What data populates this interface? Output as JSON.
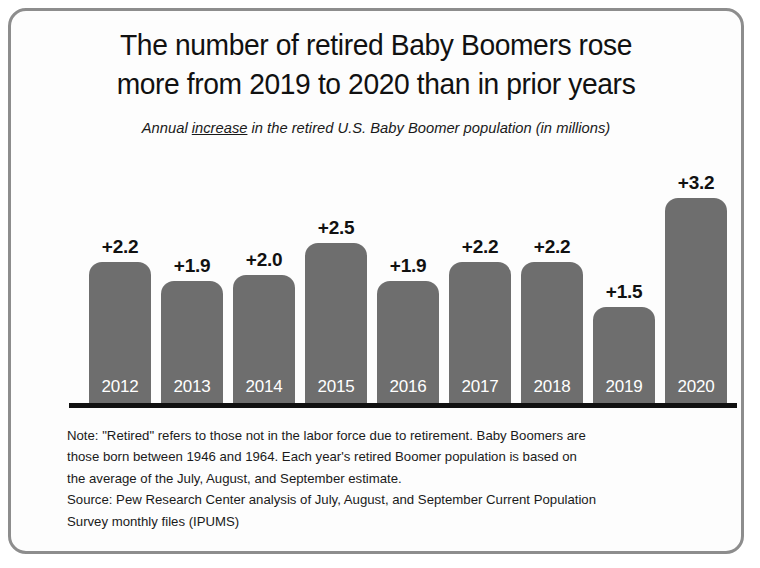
{
  "chart_data": {
    "type": "bar",
    "title": "The number of retired Baby Boomers rose more from 2019 to 2020 than in prior years",
    "title_lines": [
      "The number of retired Baby Boomers rose",
      "more from 2019 to 2020 than in prior years"
    ],
    "subtitle_prefix": "Annual ",
    "subtitle_emphasis": "increase",
    "subtitle_suffix": " in the retired U.S. Baby Boomer population (in millions)",
    "subtitle": "Annual increase in the retired U.S. Baby Boomer population (in millions)",
    "categories": [
      "2012",
      "2013",
      "2014",
      "2015",
      "2016",
      "2017",
      "2018",
      "2019",
      "2020"
    ],
    "values": [
      2.2,
      1.9,
      2.0,
      2.5,
      1.9,
      2.2,
      2.2,
      1.5,
      3.2
    ],
    "data_labels": [
      "+2.2",
      "+1.9",
      "+2.0",
      "+2.5",
      "+1.9",
      "+2.2",
      "+2.2",
      "+1.5",
      "+3.2"
    ],
    "xlabel": "",
    "ylabel": "",
    "ylim": [
      0,
      3.2
    ],
    "grid": false,
    "legend": false,
    "bar_color": "#6e6e6e",
    "label_color": "#111111",
    "year_label_color": "#ffffff",
    "baseline_color": "#111111"
  },
  "footnotes": {
    "note_lines": [
      "Note: \"Retired\" refers to those not in the labor force due to retirement. Baby Boomers are",
      "those born between 1946 and 1964. Each year's retired Boomer population is based on",
      "the average of the July, August, and September estimate."
    ],
    "source_lines": [
      "Source: Pew Research Center analysis of July, August, and September Current Population",
      "Survey monthly files (IPUMS)"
    ]
  },
  "frame": {
    "border_color": "#8d8d8d",
    "background": "#fdfdfd"
  }
}
